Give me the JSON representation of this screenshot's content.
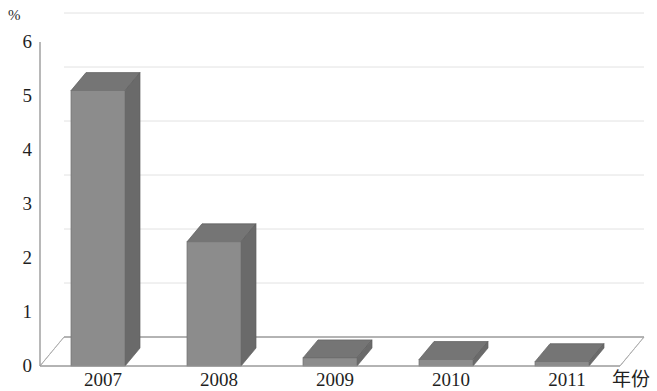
{
  "chart_data": {
    "type": "bar",
    "title": "",
    "subtitle": "",
    "xlabel": "年份",
    "ylabel": "%",
    "categories": [
      "2007",
      "2008",
      "2009",
      "2010",
      "2011"
    ],
    "values": [
      5.1,
      2.3,
      0.15,
      0.12,
      0.08
    ],
    "series": [
      {
        "name": "",
        "values": [
          5.1,
          2.3,
          0.15,
          0.12,
          0.08
        ]
      }
    ],
    "ylim": [
      0,
      6
    ],
    "ytick_labels": [
      "0",
      "1",
      "2",
      "3",
      "4",
      "5",
      "6"
    ],
    "ytick_values": [
      0,
      1,
      2,
      3,
      4,
      5,
      6
    ],
    "grid": true,
    "legend": false,
    "legend_position": "none",
    "projection": "3d",
    "colors": {
      "bar_front": "#8c8c8c",
      "bar_side": "#6a6a6a",
      "bar_top": "#757575",
      "axis_line": "#9a9a9a",
      "grid_line": "#cfcfcf",
      "background": "#ffffff",
      "text": "#1f1f1f"
    }
  },
  "axes": {
    "unit_label": "%",
    "x_title": "年份"
  }
}
